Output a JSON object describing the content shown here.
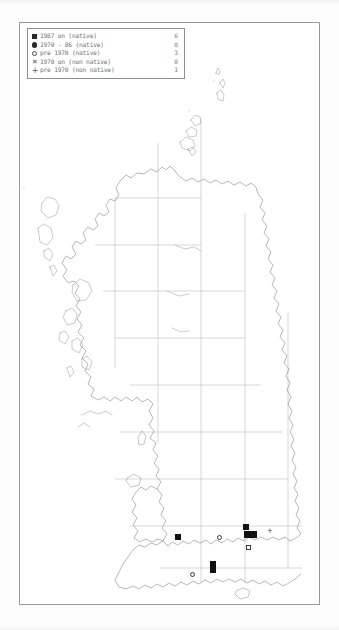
{
  "legend": {
    "rows": [
      {
        "symbol": "filled-square",
        "label": "1987 on (native)",
        "count": "6"
      },
      {
        "symbol": "filled-circle",
        "label": "1970 - 86 (native)",
        "count": "0"
      },
      {
        "symbol": "open-circle",
        "label": "pre 1970 (native)",
        "count": "3"
      },
      {
        "symbol": "cross",
        "label": "1970 on (non native)",
        "count": "0"
      },
      {
        "symbol": "plus",
        "label": "pre 1970 (non native)",
        "count": "1"
      }
    ]
  },
  "map": {
    "region": "British Isles",
    "grid": {
      "visible": true,
      "spacing_label": "100 km",
      "vertical_x": [
        114,
        157,
        200,
        244,
        287
      ],
      "horizontal_y": [
        88,
        137,
        186,
        235,
        284,
        333,
        382,
        431,
        480,
        529
      ]
    },
    "colors": {
      "coastline": "#7b7b7b",
      "grid": "#adadad",
      "frame": "#9a9a9a",
      "symbol_fill": "#111111",
      "background": "#ffffff"
    },
    "data_points": [
      {
        "type": "filled-square",
        "x": 175,
        "y": 534,
        "note": "south-east Wales"
      },
      {
        "type": "filled-square",
        "x": 243,
        "y": 524,
        "note": "south-east England north"
      },
      {
        "type": "filled-square",
        "x": 247,
        "y": 531,
        "note": "Thames valley west"
      },
      {
        "type": "filled-square",
        "x": 253,
        "y": 531,
        "note": "Thames valley east"
      },
      {
        "type": "filled-square",
        "x": 210,
        "y": 561,
        "note": "Wessex north"
      },
      {
        "type": "filled-square",
        "x": 210,
        "y": 567,
        "note": "Wessex south"
      },
      {
        "type": "open-circle",
        "x": 218,
        "y": 535,
        "note": "midlands south"
      },
      {
        "type": "open-circle",
        "x": 246,
        "y": 545,
        "note": "south of Thames"
      },
      {
        "type": "open-circle",
        "x": 190,
        "y": 572,
        "note": "south coast west"
      },
      {
        "type": "plus",
        "x": 268,
        "y": 530,
        "note": "east of London"
      }
    ],
    "marks": [
      {
        "type": "tick",
        "x": 57,
        "y": 612,
        "note": "Scilly isles inset mark"
      },
      {
        "type": "tick",
        "x": 16,
        "y": 185,
        "note": "outer isle mark"
      },
      {
        "type": "tick",
        "x": 212,
        "y": 79,
        "note": "north isle mark"
      },
      {
        "type": "tick",
        "x": 187,
        "y": 107,
        "note": "Fair Isle mark"
      }
    ]
  }
}
